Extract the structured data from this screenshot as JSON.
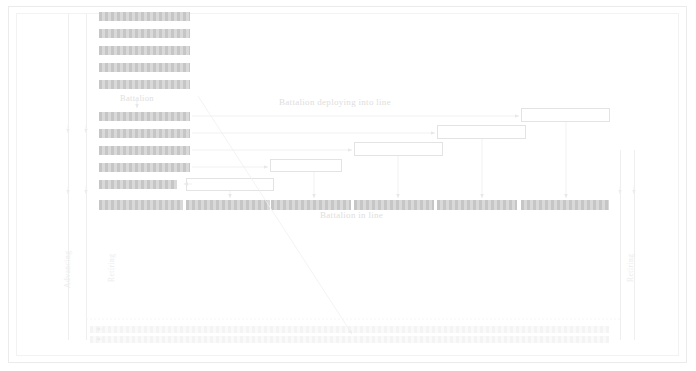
{
  "diagram": {
    "title_deploying": "Battalion deploying into line",
    "title_in_line": "Battalion in line",
    "label_battalion": "Battalion",
    "label_advancing": "Advancing",
    "label_retiring_left": "Retiring",
    "label_retiring_right": "Retiring",
    "colors": {
      "bar_fill": "#cfcfcf",
      "box_stroke": "#e3e3e3",
      "guide_line": "#efefef",
      "text": "#e0e0e0",
      "frame": "#ebebeb"
    },
    "column": {
      "description": "Battalion in column of companies",
      "company_count": 11,
      "bars": [
        {
          "index": 1,
          "x": 99,
          "y": 12,
          "w": 91,
          "h": 9
        },
        {
          "index": 2,
          "x": 99,
          "y": 29,
          "w": 91,
          "h": 9
        },
        {
          "index": 3,
          "x": 99,
          "y": 46,
          "w": 91,
          "h": 9
        },
        {
          "index": 4,
          "x": 99,
          "y": 63,
          "w": 91,
          "h": 9
        },
        {
          "index": 5,
          "x": 99,
          "y": 80,
          "w": 91,
          "h": 9
        },
        {
          "index": 6,
          "x": 99,
          "y": 112,
          "w": 91,
          "h": 9
        },
        {
          "index": 7,
          "x": 99,
          "y": 129,
          "w": 91,
          "h": 9
        },
        {
          "index": 8,
          "x": 99,
          "y": 146,
          "w": 91,
          "h": 9
        },
        {
          "index": 9,
          "x": 99,
          "y": 163,
          "w": 91,
          "h": 9
        },
        {
          "index": 10,
          "x": 99,
          "y": 180,
          "w": 78,
          "h": 9
        }
      ]
    },
    "deploying_boxes": [
      {
        "index": 1,
        "x": 521,
        "y": 108,
        "w": 89,
        "h": 14,
        "from_row": 112,
        "drop_x": 566
      },
      {
        "index": 2,
        "x": 437,
        "y": 125,
        "w": 89,
        "h": 14,
        "from_row": 129,
        "drop_x": 482
      },
      {
        "index": 3,
        "x": 354,
        "y": 142,
        "w": 89,
        "h": 14,
        "from_row": 146,
        "drop_x": 398
      },
      {
        "index": 4,
        "x": 270,
        "y": 159,
        "w": 72,
        "h": 13,
        "from_row": 163,
        "drop_x": 314
      },
      {
        "index": 5,
        "x": 186,
        "y": 178,
        "w": 88,
        "h": 13,
        "from_row": 180,
        "drop_x": 230
      }
    ],
    "line_segments": [
      {
        "index": 1,
        "x": 99,
        "y": 200,
        "w": 84,
        "h": 10
      },
      {
        "index": 2,
        "x": 186,
        "y": 200,
        "w": 84,
        "h": 10
      },
      {
        "index": 3,
        "x": 271,
        "y": 200,
        "w": 80,
        "h": 10
      },
      {
        "index": 4,
        "x": 354,
        "y": 200,
        "w": 80,
        "h": 10
      },
      {
        "index": 5,
        "x": 437,
        "y": 200,
        "w": 80,
        "h": 10
      },
      {
        "index": 6,
        "x": 521,
        "y": 200,
        "w": 88,
        "h": 10
      }
    ],
    "bottom_rows": [
      {
        "index": 1,
        "x": 90,
        "y": 326,
        "w": 519,
        "h": 7
      },
      {
        "index": 2,
        "x": 90,
        "y": 336,
        "w": 519,
        "h": 7
      }
    ],
    "guides": {
      "left_vertical_1_x": 68,
      "left_vertical_2_x": 86,
      "right_vertical_x": 620,
      "right_vertical_2_x": 634,
      "top_y": 14,
      "bottom_y": 340
    },
    "diagonal": {
      "x1": 198,
      "y1": 96,
      "x2": 352,
      "y2": 334
    }
  }
}
